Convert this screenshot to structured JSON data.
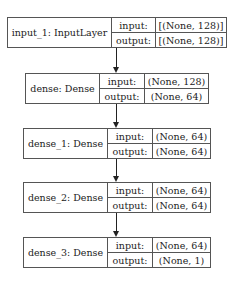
{
  "diagram": {
    "type": "keras-model-plot",
    "nodes": [
      {
        "name": "input_1: InputLayer",
        "input_label": "input:",
        "output_label": "output:",
        "input_shape": "[(None, 128)]",
        "output_shape": "[(None, 128)]"
      },
      {
        "name": "dense: Dense",
        "input_label": "input:",
        "output_label": "output:",
        "input_shape": "(None, 128)",
        "output_shape": "(None, 64)"
      },
      {
        "name": "dense_1: Dense",
        "input_label": "input:",
        "output_label": "output:",
        "input_shape": "(None, 64)",
        "output_shape": "(None, 64)"
      },
      {
        "name": "dense_2: Dense",
        "input_label": "input:",
        "output_label": "output:",
        "input_shape": "(None, 64)",
        "output_shape": "(None, 64)"
      },
      {
        "name": "dense_3: Dense",
        "input_label": "input:",
        "output_label": "output:",
        "input_shape": "(None, 64)",
        "output_shape": "(None, 1)"
      }
    ],
    "edges": [
      {
        "from": "input_1",
        "to": "dense"
      },
      {
        "from": "dense",
        "to": "dense_1"
      },
      {
        "from": "dense_1",
        "to": "dense_2"
      },
      {
        "from": "dense_2",
        "to": "dense_3"
      }
    ],
    "colors": {
      "stroke": "#555555",
      "arrow": "#222222",
      "background": "#ffffff"
    }
  }
}
